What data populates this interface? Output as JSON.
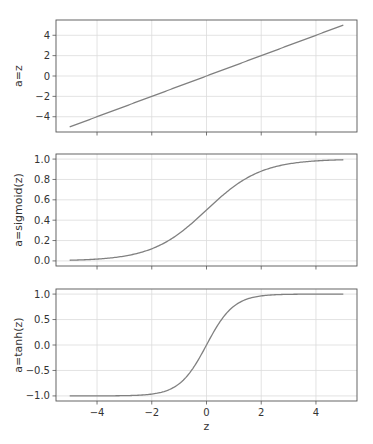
{
  "figure": {
    "width": 373,
    "height": 444,
    "background": "#ffffff"
  },
  "colors": {
    "line": "#808080",
    "grid": "#dcdcdc",
    "spine": "#555555",
    "text": "#333333"
  },
  "chart_data": [
    {
      "type": "line",
      "title": "",
      "xlabel": "",
      "ylabel": "a=z",
      "function": "linear",
      "x_range": [
        -5,
        5
      ],
      "xlim": [
        -5.5,
        5.5
      ],
      "ylim": [
        -5.5,
        5.5
      ],
      "xticks": [
        -4,
        -2,
        0,
        2,
        4
      ],
      "yticks": [
        -4,
        -2,
        0,
        2,
        4
      ],
      "ytick_labels": [
        "−4",
        "−2",
        "0",
        "2",
        "4"
      ],
      "show_xtick_labels": false,
      "grid": true,
      "series": [
        {
          "name": "a=z",
          "x": [
            -5,
            5
          ],
          "y": [
            -5,
            5
          ]
        }
      ]
    },
    {
      "type": "line",
      "title": "",
      "xlabel": "",
      "ylabel": "a=sigmoid(z)",
      "function": "sigmoid",
      "x_range": [
        -5,
        5
      ],
      "xlim": [
        -5.5,
        5.5
      ],
      "ylim": [
        -0.05,
        1.05
      ],
      "xticks": [
        -4,
        -2,
        0,
        2,
        4
      ],
      "yticks": [
        0.0,
        0.2,
        0.4,
        0.6,
        0.8,
        1.0
      ],
      "ytick_labels": [
        "0.0",
        "0.2",
        "0.4",
        "0.6",
        "0.8",
        "1.0"
      ],
      "show_xtick_labels": false,
      "grid": true,
      "series": [
        {
          "name": "a=sigmoid(z)",
          "x": [
            -5,
            -4,
            -3,
            -2,
            -1,
            0,
            1,
            2,
            3,
            4,
            5
          ],
          "y": [
            0.007,
            0.018,
            0.047,
            0.119,
            0.269,
            0.5,
            0.731,
            0.881,
            0.953,
            0.982,
            0.993
          ]
        }
      ]
    },
    {
      "type": "line",
      "title": "",
      "xlabel": "z",
      "ylabel": "a=tanh(z)",
      "function": "tanh",
      "x_range": [
        -5,
        5
      ],
      "xlim": [
        -5.5,
        5.5
      ],
      "ylim": [
        -1.1,
        1.1
      ],
      "xticks": [
        -4,
        -2,
        0,
        2,
        4
      ],
      "xtick_labels": [
        "−4",
        "−2",
        "0",
        "2",
        "4"
      ],
      "yticks": [
        -1.0,
        -0.5,
        0.0,
        0.5,
        1.0
      ],
      "ytick_labels": [
        "−1.0",
        "−0.5",
        "0.0",
        "0.5",
        "1.0"
      ],
      "show_xtick_labels": true,
      "grid": true,
      "series": [
        {
          "name": "a=tanh(z)",
          "x": [
            -5,
            -4,
            -3,
            -2,
            -1,
            0,
            1,
            2,
            3,
            4,
            5
          ],
          "y": [
            -1.0,
            -0.999,
            -0.995,
            -0.964,
            -0.762,
            0.0,
            0.762,
            0.964,
            0.995,
            0.999,
            1.0
          ]
        }
      ]
    }
  ],
  "layout": {
    "panels": [
      {
        "left": 56,
        "top": 20,
        "right": 357,
        "bottom": 132
      },
      {
        "left": 56,
        "top": 154,
        "right": 357,
        "bottom": 266
      },
      {
        "left": 56,
        "top": 289,
        "right": 357,
        "bottom": 401
      }
    ]
  }
}
